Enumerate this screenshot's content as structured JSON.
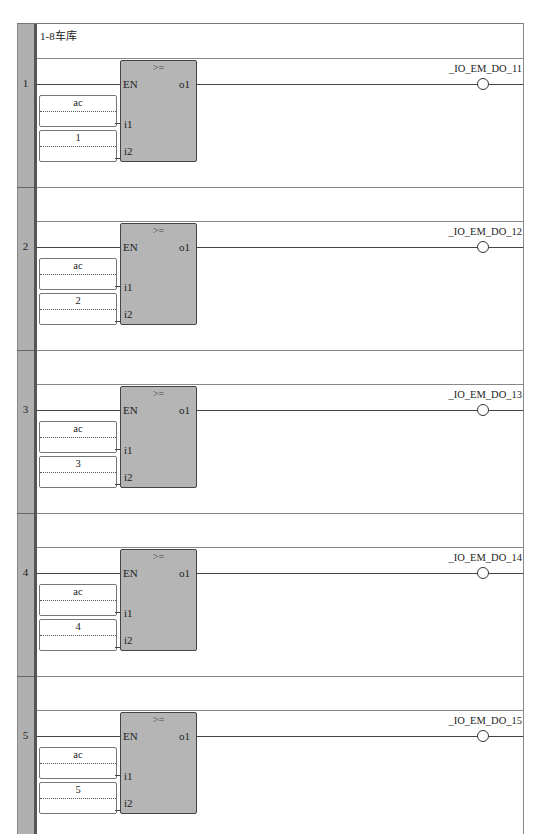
{
  "diagram": {
    "comment": "1-8车库",
    "block_operator": ">=",
    "pins": {
      "en": "EN",
      "out": "o1",
      "in1": "i1",
      "in2": "i2"
    },
    "rungs": [
      {
        "number": "1",
        "in1_var": "ac",
        "in2_const": "1",
        "coil": "_IO_EM_DO_11"
      },
      {
        "number": "2",
        "in1_var": "ac",
        "in2_const": "2",
        "coil": "_IO_EM_DO_12"
      },
      {
        "number": "3",
        "in1_var": "ac",
        "in2_const": "3",
        "coil": "_IO_EM_DO_13"
      },
      {
        "number": "4",
        "in1_var": "ac",
        "in2_const": "4",
        "coil": "_IO_EM_DO_14"
      },
      {
        "number": "5",
        "in1_var": "ac",
        "in2_const": "5",
        "coil": "_IO_EM_DO_15"
      }
    ]
  }
}
